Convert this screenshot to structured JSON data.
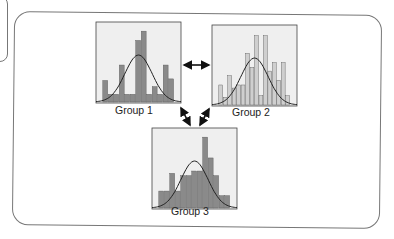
{
  "colors": {
    "dark_bar": "#8a8a8a",
    "light_bar": "#cfcfcf",
    "panel_bg": "#efefef",
    "curve": "#222222",
    "border": "#777777"
  },
  "chart_data": [
    {
      "type": "bar",
      "title": "Group 1",
      "bar_color": "#8a8a8a",
      "values": [
        28,
        10,
        10,
        48,
        10,
        10,
        80,
        92,
        10,
        20,
        10,
        48,
        30
      ],
      "normal_curve": true
    },
    {
      "type": "bar",
      "title": "Group 2",
      "bar_color": "#cfcfcf",
      "values": [
        26,
        10,
        38,
        22,
        26,
        26,
        67,
        49,
        90,
        12,
        90,
        44,
        55,
        32,
        55,
        12
      ],
      "normal_curve": true
    },
    {
      "type": "bar",
      "title": "Group 3",
      "bar_color": "#8a8a8a",
      "values": [
        22,
        22,
        45,
        22,
        42,
        42,
        48,
        48,
        92,
        65,
        42,
        16,
        16
      ],
      "normal_curve": true
    }
  ],
  "labels": {
    "g1": "Group 1",
    "g2": "Group 2",
    "g3": "Group 3"
  },
  "arrows": [
    "g1-g2",
    "g1-g3",
    "g2-g3"
  ]
}
